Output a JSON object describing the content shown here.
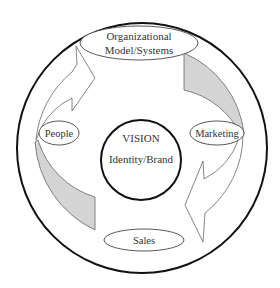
{
  "diagram": {
    "center": {
      "title": "VISION",
      "subtitle": "Identity/Brand"
    },
    "nodes": {
      "top": {
        "line1": "Organizational",
        "line2": "Model/Systems"
      },
      "left": {
        "label": "People"
      },
      "right": {
        "label": "Marketing"
      },
      "bottom": {
        "label": "Sales"
      }
    },
    "flow": {
      "direction": "clockwise",
      "arrows": [
        {
          "from": "People",
          "to": "Organizational Model/Systems",
          "style": "outline"
        },
        {
          "from": "Organizational Model/Systems",
          "to": "Marketing",
          "style": "shaded"
        },
        {
          "from": "Marketing",
          "to": "Sales",
          "style": "outline"
        },
        {
          "from": "Sales",
          "to": "People",
          "style": "shaded"
        }
      ]
    },
    "colors": {
      "stroke": "#111111",
      "thin_stroke": "#555555",
      "shade": "#d4d4d4",
      "background": "#ffffff",
      "text": "#333333"
    }
  }
}
